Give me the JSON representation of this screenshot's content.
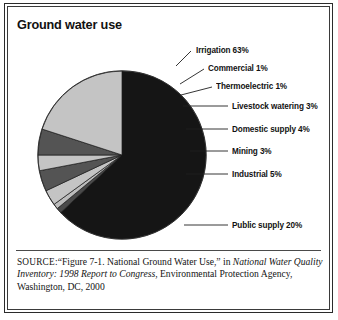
{
  "figure": {
    "title": "Ground water use"
  },
  "chart_data": {
    "type": "pie",
    "title": "Ground water use",
    "xlabel": "",
    "ylabel": "",
    "unit": "percent",
    "start_angle_deg": 0,
    "direction": "clockwise",
    "legend": "callout-labels",
    "grid": false,
    "categories": [
      "Irrigation",
      "Commercial",
      "Thermoelectric",
      "Livestock watering",
      "Domestic supply",
      "Mining",
      "Industrial",
      "Public supply"
    ],
    "values": [
      63,
      1,
      1,
      3,
      4,
      3,
      5,
      20
    ],
    "slices": [
      {
        "label": "Irrigation 63%",
        "name": "Irrigation",
        "value": 63,
        "color": "#151515"
      },
      {
        "label": "Commercial 1%",
        "name": "Commercial",
        "value": 1,
        "color": "#4a4a4a"
      },
      {
        "label": "Thermoelectric 1%",
        "name": "Thermoelectric",
        "value": 1,
        "color": "#bdbdbd"
      },
      {
        "label": "Livestock watering 3%",
        "name": "Livestock watering",
        "value": 3,
        "color": "#c4c4c4"
      },
      {
        "label": "Domestic supply 4%",
        "name": "Domestic supply",
        "value": 4,
        "color": "#545454"
      },
      {
        "label": "Mining 3%",
        "name": "Mining",
        "value": 3,
        "color": "#c4c4c4"
      },
      {
        "label": "Industrial 5%",
        "name": "Industrial",
        "value": 5,
        "color": "#545454"
      },
      {
        "label": "Public supply 20%",
        "name": "Public supply",
        "value": 20,
        "color": "#c4c4c4"
      }
    ]
  },
  "source": {
    "prefix": "SOURCE:",
    "line_plain_1": "“Figure 7-1. National Ground Water Use,” in ",
    "italic_1": "National Water Quality Inventory: 1998 Report to Congress",
    "line_plain_2": ", Environmental Protection Agency, Washington, DC, 2000"
  }
}
